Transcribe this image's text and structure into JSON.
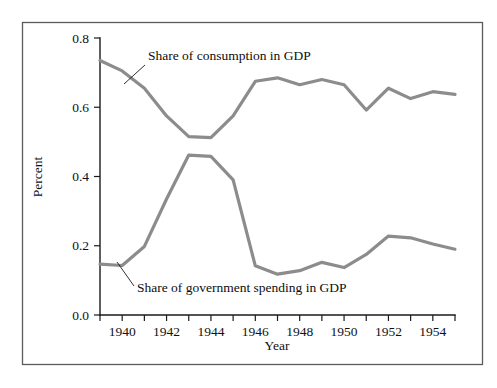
{
  "figure": {
    "background_color": "#ffffff",
    "frame_color": "#5a5a5a",
    "axis_color": "#1a1a1a"
  },
  "chart_data": {
    "type": "line",
    "title": "",
    "xlabel": "Year",
    "ylabel": "Percent",
    "xlim": [
      1939,
      1955
    ],
    "ylim": [
      0.0,
      0.8
    ],
    "grid": false,
    "legend_position": "inline-annotations",
    "x_tick_labels": [
      "1940",
      "1942",
      "1944",
      "1946",
      "1948",
      "1950",
      "1952",
      "1954"
    ],
    "x_tick_values": [
      1940,
      1942,
      1944,
      1946,
      1948,
      1950,
      1952,
      1954
    ],
    "x_minor_tick_values": [
      1939,
      1941,
      1943,
      1945,
      1947,
      1949,
      1951,
      1953,
      1955
    ],
    "y_tick_labels": [
      "0.0",
      "0.2",
      "0.4",
      "0.6",
      "0.8"
    ],
    "y_tick_values": [
      0.0,
      0.2,
      0.4,
      0.6,
      0.8
    ],
    "x": [
      1939,
      1940,
      1941,
      1942,
      1943,
      1944,
      1945,
      1946,
      1947,
      1948,
      1949,
      1950,
      1951,
      1952,
      1953,
      1954,
      1955
    ],
    "series": [
      {
        "name": "Share of consumption in GDP",
        "color": "#8c8c8c",
        "values": [
          0.735,
          0.705,
          0.655,
          0.575,
          0.515,
          0.512,
          0.575,
          0.675,
          0.685,
          0.665,
          0.68,
          0.665,
          0.592,
          0.655,
          0.625,
          0.645,
          0.637
        ]
      },
      {
        "name": "Share of government spending in GDP",
        "color": "#8c8c8c",
        "values": [
          0.147,
          0.143,
          0.198,
          0.335,
          0.462,
          0.458,
          0.39,
          0.142,
          0.118,
          0.128,
          0.152,
          0.137,
          0.175,
          0.228,
          0.223,
          0.205,
          0.19
        ]
      }
    ],
    "annotations": [
      {
        "text": "Share of consumption in GDP",
        "series": "Share of consumption in GDP",
        "text_x": 148,
        "text_y": 60,
        "leader_from_x": 145,
        "leader_from_y": 65,
        "leader_to_x": 124,
        "leader_to_y": 84
      },
      {
        "text": "Share of government spending in GDP",
        "series": "Share of government spending in GDP",
        "text_x": 137,
        "text_y": 292,
        "leader_from_x": 134,
        "leader_from_y": 286,
        "leader_to_x": 117,
        "leader_to_y": 262
      }
    ]
  }
}
